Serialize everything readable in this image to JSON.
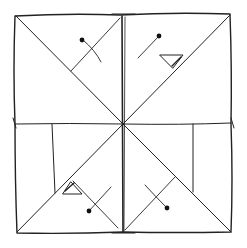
{
  "diagram": {
    "type": "hand-drawn fold pattern sketch",
    "background": "#ffffff",
    "ink_color": "#222222",
    "outer_square": {
      "x1": 14,
      "y1": 15,
      "x2": 232,
      "y2": 232
    },
    "center": {
      "x": 123,
      "y": 124
    },
    "flaps": [
      {
        "name": "top-left-quadrant",
        "dot": {
          "x": 82,
          "y": 40
        }
      },
      {
        "name": "top-right-quadrant",
        "dot": {
          "x": 159,
          "y": 36
        }
      },
      {
        "name": "bottom-left-quadrant",
        "dot": {
          "x": 89,
          "y": 211
        }
      },
      {
        "name": "bottom-right-quadrant",
        "dot": {
          "x": 167,
          "y": 208
        }
      }
    ]
  }
}
